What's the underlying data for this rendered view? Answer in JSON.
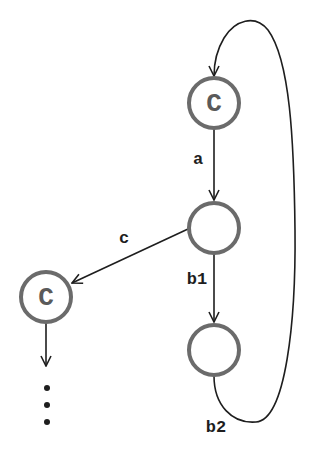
{
  "diagram": {
    "type": "state-graph",
    "colors": {
      "background": "#ffffff",
      "node_stroke": "#6b6b6b",
      "edge": "#1e1e1e",
      "node_label": "#5a5a5a"
    },
    "nodes": [
      {
        "id": "n1",
        "label": "C",
        "cx": 214,
        "cy": 103
      },
      {
        "id": "n2",
        "label": "",
        "cx": 214,
        "cy": 228
      },
      {
        "id": "n3",
        "label": "C",
        "cx": 46,
        "cy": 297
      },
      {
        "id": "n4",
        "label": "",
        "cx": 214,
        "cy": 350
      }
    ],
    "edges": [
      {
        "from": "n1",
        "to": "n2",
        "label": "a"
      },
      {
        "from": "n2",
        "to": "n3",
        "label": "c"
      },
      {
        "from": "n2",
        "to": "n4",
        "label": "b1"
      },
      {
        "from": "n4",
        "to": "n1",
        "label": "b2"
      },
      {
        "from": "n3",
        "to": "continuation",
        "label": ""
      }
    ],
    "continuation": "⋮"
  }
}
